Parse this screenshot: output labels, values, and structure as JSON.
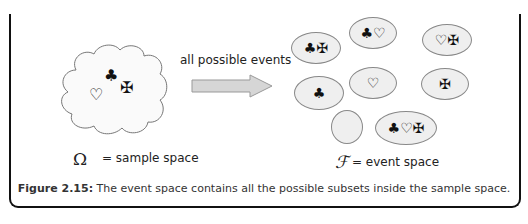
{
  "sample_space": {
    "symbol": "Ω",
    "label": "= sample space",
    "elements": [
      "♣",
      "♡",
      "✠"
    ]
  },
  "arrow": {
    "label": "all possible events"
  },
  "event_space": {
    "symbol": "ℱ",
    "label": "= event space",
    "sets": [
      {
        "content": "♣✠"
      },
      {
        "content": "♣♡"
      },
      {
        "content": "♡✠"
      },
      {
        "content": "♣"
      },
      {
        "content": "♡"
      },
      {
        "content": "✠"
      },
      {
        "content": ""
      },
      {
        "content": "♣♡✠"
      }
    ]
  },
  "caption": {
    "number": "Figure 2.15:",
    "text": " The event space contains all the possible subsets inside the sample space."
  }
}
